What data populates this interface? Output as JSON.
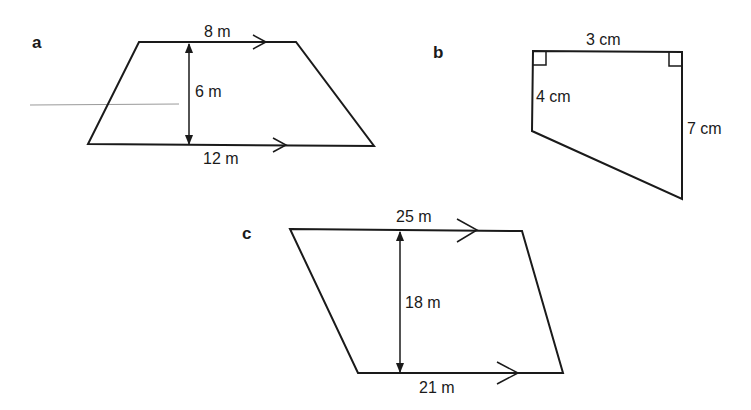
{
  "figures": [
    {
      "id": "a",
      "label": "a",
      "shape": "trapezium",
      "top": "8 m",
      "height": "6 m",
      "bottom": "12 m"
    },
    {
      "id": "b",
      "label": "b",
      "shape": "right trapezium",
      "top": "3 cm",
      "left": "4 cm",
      "right": "7 cm"
    },
    {
      "id": "c",
      "label": "c",
      "shape": "trapezium",
      "top": "25 m",
      "height": "18 m",
      "bottom": "21 m"
    }
  ],
  "colors": {
    "stroke": "#1a1a1a",
    "stray_line": "#9a9a9a"
  }
}
